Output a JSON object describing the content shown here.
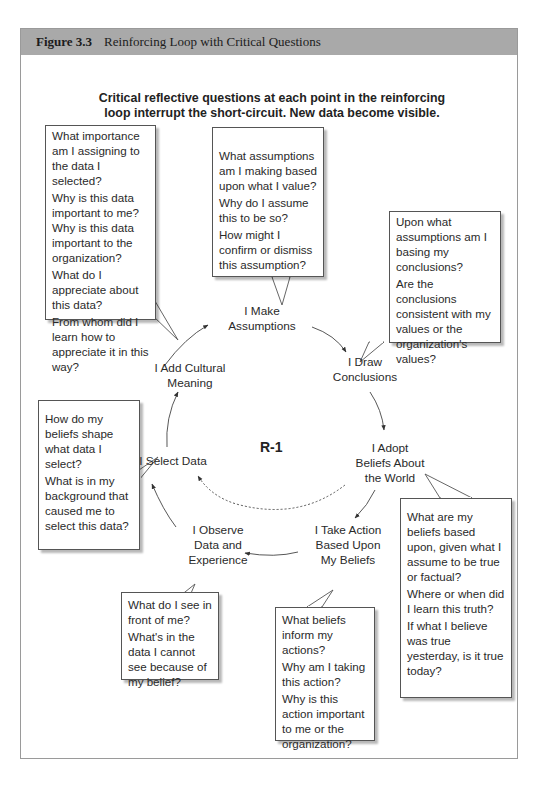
{
  "figure": {
    "number": "Figure 3.3",
    "title": "Reinforcing Loop with Critical Questions",
    "header_color": "#a9a9a9"
  },
  "subtitle": {
    "line1": "Critical reflective questions at each point in the reinforcing",
    "line2": "loop interrupt the short-circuit. New data become visible."
  },
  "loop_label": "R-1",
  "nodes": {
    "make_assumptions": [
      "I Make",
      "Assumptions"
    ],
    "draw_conclusions": [
      "I Draw",
      "Conclusions"
    ],
    "adopt_beliefs": [
      "I Adopt",
      "Beliefs About",
      "the World"
    ],
    "take_action": [
      "I Take Action",
      "Based Upon",
      "My Beliefs"
    ],
    "observe_data": [
      "I Observe",
      "Data and",
      "Experience"
    ],
    "select_data": [
      "I Select Data"
    ],
    "add_meaning": [
      "I Add Cultural",
      "Meaning"
    ]
  },
  "callouts": {
    "add_meaning": [
      "What importance am I assigning to the data I selected?",
      "Why is this data important to me? Why is this data important to the organization?",
      "What do I appreciate about this data?",
      "From whom did I learn how to appreciate it in this way?"
    ],
    "make_assumptions": [
      "What assumptions am I making based upon what I value?",
      "Why do I assume this to be so?",
      "How might I confirm or dismiss this assumption?"
    ],
    "draw_conclusions": [
      "Upon what assumptions am I basing my conclusions?",
      "Are the conclusions consistent with my values or the organization's values?"
    ],
    "select_data": [
      "How do my beliefs shape what data I select?",
      "What is in my background that caused me to select this data?"
    ],
    "adopt_beliefs": [
      "What are my beliefs based upon, given what I assume to be true or factual?",
      "Where or when did I learn this truth?",
      "If what I believe was true yesterday, is it true today?"
    ],
    "observe_data": [
      "What do I see in front of me?",
      "What's in the data I cannot see because of my belief?"
    ],
    "take_action": [
      "What beliefs inform my actions?",
      "Why am I taking this action?",
      "Why is this action important to me or the organization?"
    ]
  }
}
